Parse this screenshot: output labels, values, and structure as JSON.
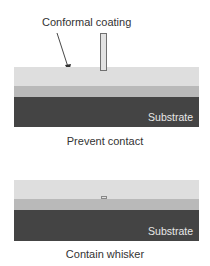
{
  "panels": [
    {
      "id": "prevent-contact",
      "callout_label": "Conformal coating",
      "substrate_label": "Substrate",
      "caption": "Prevent contact"
    },
    {
      "id": "contain-whisker",
      "substrate_label": "Substrate",
      "caption": "Contain whisker"
    }
  ],
  "colors": {
    "coating": "#dedede",
    "intermediate_layer": "#b9b9b9",
    "substrate": "#444444",
    "whisker_outline": "#707070"
  }
}
